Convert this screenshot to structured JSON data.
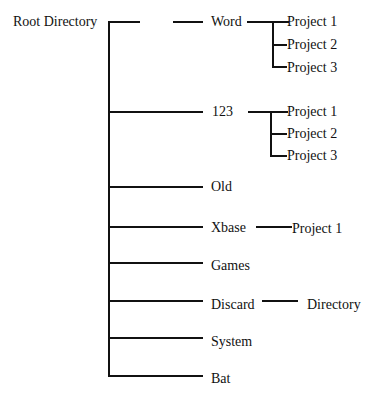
{
  "root": {
    "label": "Root Directory"
  },
  "children": [
    {
      "label": "Word",
      "sub": [
        "Project 1",
        "Project 2",
        "Project 3"
      ]
    },
    {
      "label": "123",
      "sub": [
        "Project 1",
        "Project 2",
        "Project 3"
      ]
    },
    {
      "label": "Old"
    },
    {
      "label": "Xbase",
      "sub": [
        "Project 1"
      ]
    },
    {
      "label": "Games"
    },
    {
      "label": "Discard",
      "sub": [
        "Directory"
      ]
    },
    {
      "label": "System"
    },
    {
      "label": "Bat"
    }
  ]
}
